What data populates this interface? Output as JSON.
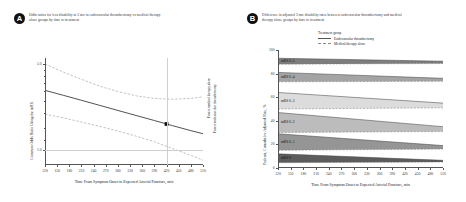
{
  "figure": {
    "panels": [
      {
        "badge": "A",
        "title": "Odds ratios for less disability at 3 mo in endovascular thrombectomy vs medical therapy alone groups by time to treatment"
      },
      {
        "badge": "B",
        "title": "Difference in adjusted 3-mo disability rates between endovascular thrombectomy and medical therapy alone groups by time to treatment"
      }
    ]
  },
  "legend": {
    "title": "Treatment group",
    "items": [
      {
        "label": "Endovascular thrombectomy",
        "style": "solid",
        "color": "#555555"
      },
      {
        "label": "Medical therapy alone",
        "style": "dashed",
        "color": "#888888"
      }
    ]
  },
  "side_notes": {
    "favors_evt": "Favors endovascular thrombectomy",
    "favors_medical": "Favors medical therapy alone"
  },
  "chart_data": [
    {
      "type": "line",
      "panel": "A",
      "title": "Odds ratios for less disability at 3 mo in endovascular thrombectomy vs medical therapy alone groups by time to treatment",
      "xlabel": "Time From Symptom Onset to Expected Arterial Puncture, min",
      "ylabel": "Common Odds Ratio Using the mRS",
      "xlim": [
        120,
        510
      ],
      "ylim": [
        0.75,
        5.6
      ],
      "yscale": "log",
      "xticks": [
        120,
        150,
        180,
        210,
        240,
        270,
        300,
        330,
        360,
        390,
        420,
        450,
        480,
        510
      ],
      "yticks": [
        1.0,
        5.0
      ],
      "ytick_labels": [
        "1.0",
        "5.0"
      ],
      "grid": false,
      "reference_line_y": 1.0,
      "reference_line_x": 420,
      "series": [
        {
          "name": "Common odds ratio (point estimate)",
          "style": "solid",
          "color": "#333333",
          "x": [
            120,
            165,
            210,
            255,
            300,
            345,
            390,
            435,
            480,
            510
          ],
          "y": [
            3.05,
            2.78,
            2.53,
            2.3,
            2.09,
            1.9,
            1.73,
            1.57,
            1.43,
            1.35
          ]
        },
        {
          "name": "Upper 95% CI",
          "style": "dashed",
          "color": "#999999",
          "x": [
            120,
            165,
            210,
            255,
            300,
            345,
            390,
            435,
            480,
            510
          ],
          "y": [
            5.0,
            4.3,
            3.75,
            3.3,
            2.98,
            2.75,
            2.62,
            2.58,
            2.62,
            2.7
          ]
        },
        {
          "name": "Lower 95% CI",
          "style": "dashed",
          "color": "#999999",
          "x": [
            120,
            165,
            210,
            255,
            300,
            345,
            390,
            435,
            480,
            510
          ],
          "y": [
            1.95,
            1.82,
            1.68,
            1.55,
            1.42,
            1.29,
            1.16,
            1.02,
            0.9,
            0.82
          ]
        }
      ],
      "annotations": [
        {
          "name": "point-estimate-marker",
          "x": 420,
          "y": 1.62,
          "marker": "filled-square"
        }
      ]
    },
    {
      "type": "area",
      "panel": "B",
      "title": "Difference in adjusted 3-mo disability rates between endovascular thrombectomy and medical therapy alone groups by time to treatment",
      "xlabel": "Time From Symptom Onset to Expected Arterial Puncture, min",
      "ylabel": "Patients, Cumulative Adjusted Rate, %",
      "xlim": [
        120,
        510
      ],
      "ylim": [
        0,
        100
      ],
      "xticks": [
        120,
        150,
        180,
        210,
        240,
        270,
        300,
        330,
        360,
        390,
        420,
        450,
        480,
        510
      ],
      "yticks": [
        0,
        20,
        40,
        60,
        80,
        100
      ],
      "grid": false,
      "x": [
        120,
        510
      ],
      "bands": [
        {
          "label": "mRS 0–5",
          "fill": "#6f6f6f",
          "evt": [
            93.0,
            90.5
          ],
          "medical": [
            88.0,
            88.5
          ]
        },
        {
          "label": "mRS 0–4",
          "fill": "#9a9a9a",
          "evt": [
            81.0,
            76.0
          ],
          "medical": [
            73.0,
            73.5
          ]
        },
        {
          "label": "mRS 0–3",
          "fill": "#d8d8d8",
          "evt": [
            64.0,
            55.0
          ],
          "medical": [
            50.0,
            51.0
          ]
        },
        {
          "label": "mRS 0–2",
          "fill": "#b5b5b5",
          "evt": [
            47.0,
            35.0
          ],
          "medical": [
            30.0,
            31.0
          ]
        },
        {
          "label": "mRS 0–1",
          "fill": "#8a8a8a",
          "evt": [
            29.0,
            19.0
          ],
          "medical": [
            15.0,
            16.0
          ]
        },
        {
          "label": "mRS 0",
          "fill": "#4a4a4a",
          "evt": [
            12.0,
            6.5
          ],
          "medical": [
            4.5,
            5.0
          ]
        }
      ]
    }
  ]
}
